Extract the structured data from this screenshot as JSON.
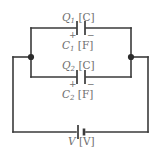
{
  "figure": {
    "name": "parallel-capacitor-circuit",
    "background_color": "#ffffff",
    "wire_color": "#3a3a3a",
    "label_color": "#6e6e6e"
  },
  "labels": {
    "charge1": {
      "symbol": "Q",
      "subscript": "1",
      "unit": "[C]"
    },
    "capacitance1": {
      "symbol": "C",
      "subscript": "1",
      "unit": "[F]"
    },
    "charge2": {
      "symbol": "Q",
      "subscript": "2",
      "unit": "[C]"
    },
    "capacitance2": {
      "symbol": "C",
      "subscript": "2",
      "unit": "[F]"
    },
    "voltage": {
      "symbol": "V",
      "subscript": "",
      "unit": "[V]"
    }
  },
  "polarity": {
    "capacitor1_left": "+",
    "capacitor1_right": "−",
    "capacitor2_left": "+",
    "capacitor2_right": "−"
  },
  "components": [
    {
      "name": "capacitor-1",
      "type": "capacitor",
      "label": "C1",
      "charge_label": "Q1"
    },
    {
      "name": "capacitor-2",
      "type": "capacitor",
      "label": "C2",
      "charge_label": "Q2"
    },
    {
      "name": "battery",
      "type": "battery",
      "label": "V"
    }
  ],
  "junctions": [
    {
      "name": "junction-left",
      "x": 31,
      "y": 57
    },
    {
      "name": "junction-right",
      "x": 131,
      "y": 57
    }
  ]
}
